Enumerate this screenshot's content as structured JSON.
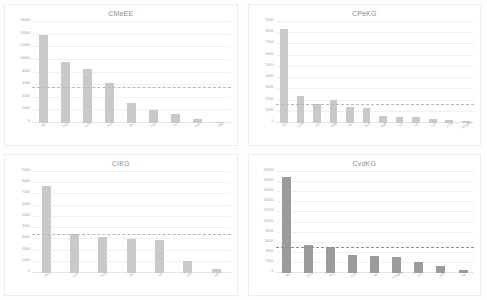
{
  "figure": {
    "panel_count": 4,
    "bar_color": "#c9c9c9",
    "bar_color_dark": "#9b9b9b",
    "avg_line_color": "#b9b9b9",
    "grid_color": "#f1f1f1"
  },
  "chart_data": [
    {
      "type": "bar",
      "title": "CMeEE",
      "xlabel": "",
      "ylabel": "",
      "ylim": [
        0,
        16000
      ],
      "yticks": [
        0,
        2000,
        4000,
        6000,
        8000,
        10000,
        12000,
        14000,
        16000
      ],
      "ytick_labels": [
        "0",
        "2000",
        "4000",
        "6000",
        "8000",
        "10000",
        "12000",
        "14000",
        "16000"
      ],
      "grid": true,
      "legend": "none",
      "categories": [
        "dis",
        "bod",
        "sym",
        "pro",
        "dru",
        "mic",
        "ite",
        "equ",
        "dep"
      ],
      "values": [
        13900,
        9700,
        8500,
        6300,
        3100,
        2100,
        1500,
        600,
        220
      ],
      "average_line": 5600,
      "annotation": "dashed horizontal average line"
    },
    {
      "type": "bar",
      "title": "CPeKG",
      "xlabel": "",
      "ylabel": "",
      "ylim": [
        0,
        9000
      ],
      "yticks": [
        0,
        1000,
        2000,
        3000,
        4000,
        5000,
        6000,
        7000,
        8000,
        9000
      ],
      "ytick_labels": [
        "0",
        "1000",
        "2000",
        "3000",
        "4000",
        "5000",
        "6000",
        "7000",
        "8000",
        "9000"
      ],
      "grid": true,
      "legend": "none",
      "categories": [
        "dis",
        "sym",
        "dru",
        "bdg",
        "ite",
        "bod",
        "age",
        "sct",
        "sit",
        "sci",
        "s.he",
        "surgery"
      ],
      "values": [
        8400,
        2450,
        1700,
        2050,
        1400,
        1350,
        600,
        560,
        540,
        380,
        230,
        190
      ],
      "average_line": 1620,
      "annotation": "dashed horizontal average line"
    },
    {
      "type": "bar",
      "title": "CIKG",
      "xlabel": "",
      "ylabel": "",
      "ylim": [
        0,
        9000
      ],
      "yticks": [
        0,
        1000,
        2000,
        3000,
        4000,
        5000,
        6000,
        7000,
        8000,
        9000
      ],
      "ytick_labels": [
        "0",
        "1000",
        "2000",
        "3000",
        "4000",
        "5000",
        "6000",
        "7000",
        "8000",
        "9000"
      ],
      "grid": true,
      "legend": "none",
      "categories": [
        "dis",
        "sym",
        "med",
        "ite",
        "tre",
        "use",
        "set"
      ],
      "values": [
        7750,
        3450,
        3200,
        3050,
        2900,
        1100,
        350
      ],
      "average_line": 3400,
      "annotation": "dashed horizontal average line"
    },
    {
      "type": "bar",
      "title": "CvdKG",
      "xlabel": "",
      "ylabel": "",
      "ylim": [
        0,
        20000
      ],
      "yticks": [
        0,
        2000,
        4000,
        6000,
        8000,
        10000,
        12000,
        14000,
        16000,
        18000,
        20000
      ],
      "ytick_labels": [
        "0",
        "2000",
        "4000",
        "6000",
        "8000",
        "10000",
        "12000",
        "14000",
        "16000",
        "18000",
        "20000"
      ],
      "grid": true,
      "legend": "none",
      "categories": [
        "dis",
        "med",
        "dru",
        "sym",
        "ite",
        "surgery",
        "tre",
        "adj",
        "epi"
      ],
      "values": [
        19000,
        5600,
        5100,
        3600,
        3350,
        3150,
        2250,
        1400,
        550
      ],
      "average_line": 4900,
      "annotation": "dashed horizontal average line"
    }
  ]
}
